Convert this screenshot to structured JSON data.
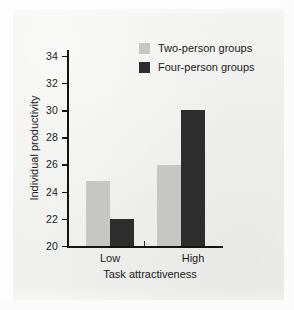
{
  "chart_data": {
    "type": "bar",
    "title": "",
    "subtitle": "",
    "xlabel": "Task attractiveness",
    "ylabel": "Individual productivity",
    "categories": [
      "Low",
      "High"
    ],
    "series": [
      {
        "name": "Two-person groups",
        "values": [
          24.8,
          26.0
        ],
        "color": "#c6c6c4"
      },
      {
        "name": "Four-person groups",
        "values": [
          22.0,
          30.0
        ],
        "color": "#2d2d2d"
      }
    ],
    "ylim": [
      20,
      34
    ],
    "yticks": [
      20,
      22,
      24,
      26,
      28,
      30,
      32,
      34
    ],
    "ytick_labels": [
      "20",
      "22",
      "24",
      "26",
      "28",
      "30",
      "32",
      "34"
    ],
    "grid": false,
    "legend_position": "top-right",
    "axis_spines": [
      "left",
      "bottom"
    ]
  },
  "legend": {
    "entries": [
      {
        "label": "Two-person groups",
        "swatch": "legend-swatch-light"
      },
      {
        "label": "Four-person groups",
        "swatch": "legend-swatch-dark"
      }
    ]
  },
  "axes": {
    "y_title": "Individual productivity",
    "x_title": "Task attractiveness",
    "y_tick_0": "20",
    "y_tick_1": "22",
    "y_tick_2": "24",
    "y_tick_3": "26",
    "y_tick_4": "28",
    "y_tick_5": "30",
    "y_tick_6": "32",
    "y_tick_7": "34",
    "x_cat_0": "Low",
    "x_cat_1": "High"
  },
  "colors": {
    "series_light": "#c6c6c4",
    "series_dark": "#2d2d2d",
    "axis": "#141414",
    "text": "#1b1b1b",
    "background": "#f1f1ef"
  }
}
